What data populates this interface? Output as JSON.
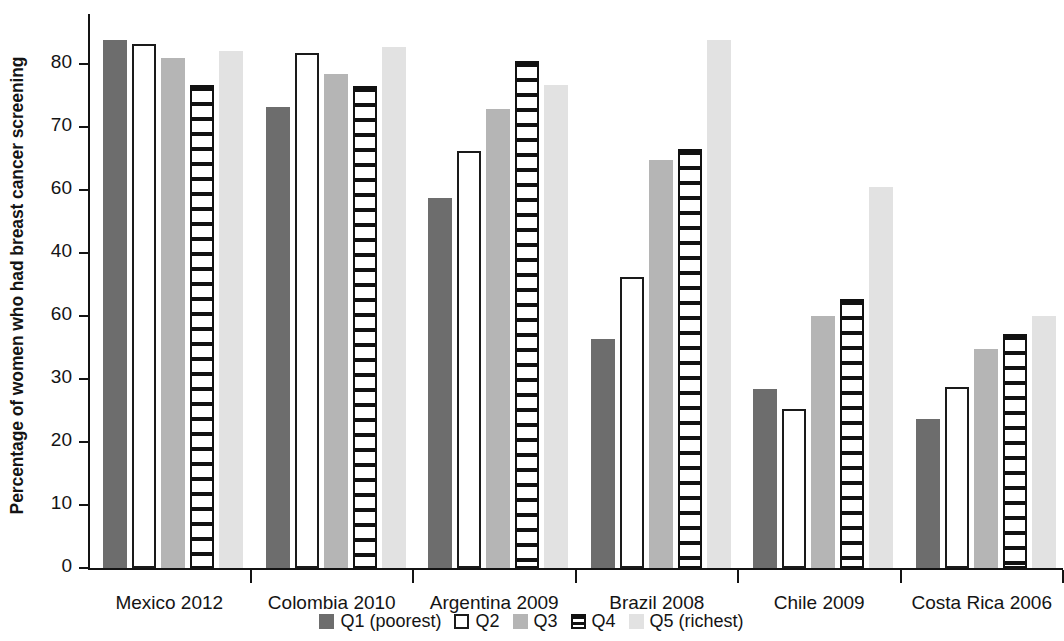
{
  "chart_data": {
    "type": "bar",
    "title": "",
    "xlabel": "",
    "ylabel": "Percentage of women who had breast cancer screening",
    "ylim": [
      0,
      88
    ],
    "yticks": [
      0,
      10,
      20,
      30,
      40,
      50,
      60,
      70,
      80
    ],
    "ytick_labels": [
      "0",
      "10",
      "20",
      "30",
      "60",
      "40",
      "60",
      "70",
      "80"
    ],
    "grid": false,
    "legend_position": "bottom",
    "categories": [
      "Mexico 2012",
      "Colombia 2010",
      "Argentina 2009",
      "Brazil 2008",
      "Chile 2009",
      "Costa Rica 2006"
    ],
    "series": [
      {
        "name": "Q1 (poorest)",
        "key": "q1",
        "color": "#6d6d6d",
        "pattern": "solid-dark-gray",
        "values": [
          83.8,
          73.2,
          58.8,
          36.4,
          28.5,
          23.6
        ]
      },
      {
        "name": "Q2",
        "key": "q2",
        "color": "#ffffff",
        "pattern": "white-outlined",
        "values": [
          83.3,
          81.8,
          66.2,
          46.3,
          25.2,
          28.8
        ]
      },
      {
        "name": "Q3",
        "key": "q3",
        "color": "#b5b5b5",
        "pattern": "solid-mid-gray",
        "values": [
          81.0,
          78.4,
          72.9,
          64.8,
          40.0,
          34.8
        ]
      },
      {
        "name": "Q4",
        "key": "q4",
        "color": "#111111",
        "pattern": "horizontal-stripes",
        "values": [
          76.8,
          76.6,
          80.6,
          66.5,
          42.7,
          37.1
        ]
      },
      {
        "name": "Q5 (richest)",
        "key": "q5",
        "color": "#e2e2e2",
        "pattern": "solid-light-gray",
        "values": [
          82.2,
          82.7,
          76.7,
          83.9,
          60.6,
          40.0
        ]
      }
    ]
  },
  "axis": {
    "y_title": "Percentage of women who had breast cancer screening"
  },
  "legend": {
    "items": [
      {
        "label": "Q1 (poorest)",
        "key": "q1"
      },
      {
        "label": "Q2",
        "key": "q2"
      },
      {
        "label": "Q3",
        "key": "q3"
      },
      {
        "label": "Q4",
        "key": "q4"
      },
      {
        "label": "Q5 (richest)",
        "key": "q5"
      }
    ]
  }
}
